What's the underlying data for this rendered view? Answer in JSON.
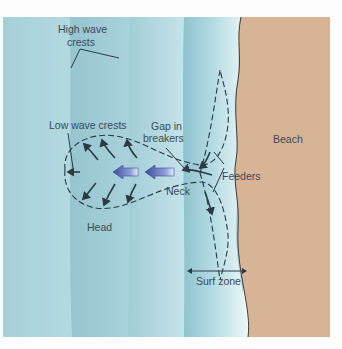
{
  "labels": {
    "high_wave_crests_line1": "High wave",
    "high_wave_crests_line2": "crests",
    "low_wave_crests": "Low wave crests",
    "gap_line1": "Gap in",
    "gap_line2": "breakers",
    "beach": "Beach",
    "feeders": "Feeders",
    "neck": "Neck",
    "head": "Head",
    "surf_zone": "Surf zone"
  },
  "colors": {
    "water_light": "#b9dde4",
    "water_mid": "#9fcbd5",
    "water_dark": "#8ec0cc",
    "surf_white": "#e4f3f5",
    "sand": "#d8b496",
    "rip_arrow": "#4a56a6",
    "line": "#2c3a44"
  }
}
